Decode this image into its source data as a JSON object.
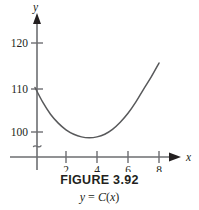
{
  "figure": {
    "caption_title": "FIGURE 3.92",
    "caption_equation_y": "y",
    "caption_equation_eq": " = ",
    "caption_equation_fn": "C",
    "caption_equation_open": "(",
    "caption_equation_arg": "x",
    "caption_equation_close": ")",
    "caption_equation_full": "y = C(x)"
  },
  "axes": {
    "x_axis_name": "x",
    "y_axis_name": "y",
    "x_tick_labels": [
      "2",
      "4",
      "6",
      "8"
    ],
    "y_tick_labels": [
      "100",
      "110",
      "120"
    ],
    "has_axis_break": true,
    "axis_color": "#6d6e71",
    "curve_color": "#58595b"
  },
  "chart_data": {
    "type": "line",
    "title": "FIGURE 3.92",
    "subtitle": "y = C(x)",
    "xlabel": "x",
    "ylabel": "y",
    "xlim": [
      0,
      8.6
    ],
    "ylim": [
      96.5,
      122
    ],
    "grid": false,
    "legend": null,
    "y_axis_break": true,
    "x_ticks": [
      2,
      4,
      6,
      8
    ],
    "y_ticks": [
      100,
      110,
      120
    ],
    "series": [
      {
        "name": "C(x)",
        "x": [
          0.0,
          0.5,
          1.0,
          1.5,
          2.0,
          2.5,
          3.0,
          3.5,
          4.0,
          4.5,
          5.0,
          5.5,
          6.0,
          6.5,
          7.0,
          7.5,
          8.0
        ],
        "values": [
          110.0,
          106.7,
          104.0,
          102.0,
          100.5,
          99.5,
          98.9,
          98.7,
          98.9,
          99.5,
          100.6,
          102.2,
          104.2,
          106.7,
          109.6,
          112.4,
          115.5
        ]
      }
    ],
    "minimum_point": {
      "x": 3.5,
      "y": 98.7
    },
    "endpoints": [
      {
        "x": 0,
        "y": 110.0
      },
      {
        "x": 8,
        "y": 115.5
      }
    ]
  }
}
